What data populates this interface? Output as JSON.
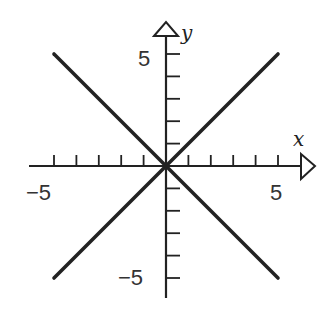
{
  "chart_data": {
    "type": "line",
    "title": "",
    "xlabel": "x",
    "ylabel": "y",
    "xlim": [
      -5,
      5
    ],
    "ylim": [
      -5,
      5
    ],
    "grid": false,
    "legend": null,
    "x_tick_labels": [
      {
        "value": -5,
        "label": "−5"
      },
      {
        "value": 5,
        "label": "5"
      }
    ],
    "y_tick_labels": [
      {
        "value": 5,
        "label": "5"
      },
      {
        "value": -5,
        "label": "−5"
      }
    ],
    "x_ticks": [
      -5,
      -4,
      -3,
      -2,
      -1,
      1,
      2,
      3,
      4,
      5
    ],
    "y_ticks": [
      -5,
      -4,
      -3,
      -2,
      -1,
      1,
      2,
      3,
      4,
      5
    ],
    "series": [
      {
        "name": "y = x",
        "x": [
          -5,
          5
        ],
        "y": [
          -5,
          5
        ]
      },
      {
        "name": "y = -x",
        "x": [
          -5,
          5
        ],
        "y": [
          5,
          -5
        ]
      }
    ],
    "colors": {
      "line": "#222222",
      "axis": "#222222",
      "background": "#ffffff"
    }
  }
}
